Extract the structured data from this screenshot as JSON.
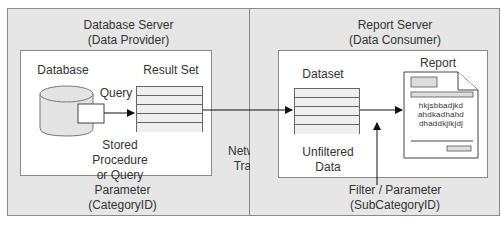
{
  "diagram": {
    "left_panel": {
      "title_line1": "Database Server",
      "title_line2": "(Data Provider)",
      "database_label": "Database",
      "query_label": "Query",
      "result_set_label": "Result Set",
      "stored_proc_line1": "Stored",
      "stored_proc_line2": "Procedure",
      "stored_proc_line3": "or Query",
      "parameter_line1": "Parameter",
      "parameter_line2": "(CategoryID)"
    },
    "network": {
      "line1": "Network",
      "line2": "Traffic"
    },
    "right_panel": {
      "title_line1": "Report Server",
      "title_line2": "(Data Consumer)",
      "dataset_label": "Dataset",
      "unfiltered_line1": "Unfiltered",
      "unfiltered_line2": "Data",
      "report_label": "Report",
      "report_text_line1": "hkjsbbadjkd",
      "report_text_line2": "ahdkadhahd",
      "report_text_line3": "dhaddkjlkjdj",
      "filter_line1": "Filter / Parameter",
      "filter_line2": "(SubCategoryID)"
    },
    "colors": {
      "outer_fill": "#e6e6e6",
      "inner_fill": "#ffffff",
      "stroke": "#555555",
      "arrow": "#111111"
    }
  }
}
